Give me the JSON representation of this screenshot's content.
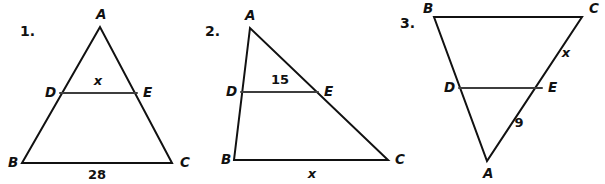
{
  "page": {
    "background_color": "#ffffff",
    "ink_color": "#111111",
    "midsegment_color": "#3d3d3d"
  },
  "problems": [
    {
      "number": "1.",
      "shape": "triangle",
      "description": "Isosceles-looking triangle ABC with apex A on top, base BC at bottom, midsegment DE parallel to BC",
      "vertices": {
        "A": {
          "label": "A",
          "x": 100,
          "y": 27
        },
        "B": {
          "label": "B",
          "x": 22,
          "y": 163
        },
        "C": {
          "label": "C",
          "x": 172,
          "y": 163
        },
        "D": {
          "label": "D",
          "x": 60,
          "y": 93
        },
        "E": {
          "label": "E",
          "x": 137,
          "y": 93
        }
      },
      "vertex_label_positions": {
        "A": {
          "x": 96,
          "y": 19
        },
        "B": {
          "x": 8,
          "y": 167
        },
        "C": {
          "x": 180,
          "y": 167
        },
        "D": {
          "x": 45,
          "y": 97
        },
        "E": {
          "x": 143,
          "y": 97
        }
      },
      "measures": [
        {
          "name": "midsegment-DE",
          "value": "x",
          "is_variable": true,
          "x": 98,
          "y": 85
        },
        {
          "name": "base-BC",
          "value": "28",
          "is_variable": false,
          "x": 97,
          "y": 179
        }
      ]
    },
    {
      "number": "2.",
      "shape": "triangle",
      "description": "Scalene triangle ABC with apex A at top left, base BC at bottom, midsegment DE parallel to BC",
      "vertices": {
        "A": {
          "label": "A",
          "x": 250,
          "y": 28
        },
        "B": {
          "label": "B",
          "x": 234,
          "y": 160
        },
        "C": {
          "label": "C",
          "x": 388,
          "y": 160
        },
        "D": {
          "label": "D",
          "x": 241,
          "y": 92
        },
        "E": {
          "label": "E",
          "x": 318,
          "y": 92
        }
      },
      "vertex_label_positions": {
        "A": {
          "x": 245,
          "y": 20
        },
        "B": {
          "x": 221,
          "y": 164
        },
        "C": {
          "x": 395,
          "y": 164
        },
        "D": {
          "x": 226,
          "y": 96
        },
        "E": {
          "x": 324,
          "y": 96
        }
      },
      "measures": [
        {
          "name": "midsegment-DE",
          "value": "15",
          "is_variable": false,
          "x": 280,
          "y": 84
        },
        {
          "name": "base-BC",
          "value": "x",
          "is_variable": true,
          "x": 312,
          "y": 178
        }
      ]
    },
    {
      "number": "3.",
      "shape": "triangle",
      "description": "Inverted triangle with BC across the top, apex A at the bottom, midsegment DE parallel to BC",
      "vertices": {
        "A": {
          "label": "A",
          "x": 487,
          "y": 161
        },
        "B": {
          "label": "B",
          "x": 434,
          "y": 17
        },
        "C": {
          "label": "C",
          "x": 582,
          "y": 17
        },
        "D": {
          "label": "D",
          "x": 459,
          "y": 88
        },
        "E": {
          "label": "E",
          "x": 542,
          "y": 88
        }
      },
      "vertex_label_positions": {
        "A": {
          "x": 483,
          "y": 178
        },
        "B": {
          "x": 423,
          "y": 13
        },
        "C": {
          "x": 589,
          "y": 13
        },
        "D": {
          "x": 444,
          "y": 92
        },
        "E": {
          "x": 548,
          "y": 92
        }
      },
      "measures": [
        {
          "name": "side-EC",
          "value": "x",
          "is_variable": true,
          "x": 566,
          "y": 57
        },
        {
          "name": "side-AE",
          "value": "9",
          "is_variable": false,
          "x": 519,
          "y": 127
        }
      ]
    }
  ]
}
